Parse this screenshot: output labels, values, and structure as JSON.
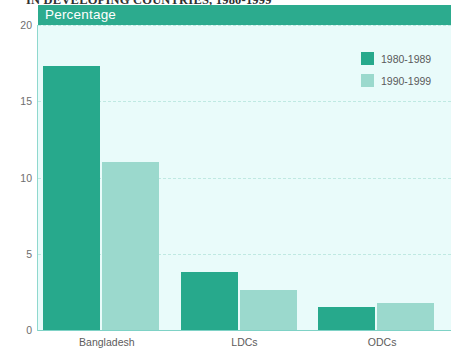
{
  "figure": {
    "title_top": "IN DEVELOPING COUNTRIES, 1980-1999",
    "band_label": "Percentage"
  },
  "colors": {
    "series_1980s": "#27a98c",
    "series_1990s": "#9bd9cd",
    "band": "#2cab8e",
    "plot_background": "#e9fbfa",
    "gridline": "#bfe9e2",
    "axis": "#7fd2c6"
  },
  "legend": {
    "position": "top-right",
    "entries": [
      {
        "label": "1980-1989",
        "color": "#27a98c"
      },
      {
        "label": "1990-1999",
        "color": "#9bd9cd"
      }
    ]
  },
  "chart_data": {
    "type": "bar",
    "title": "IN DEVELOPING COUNTRIES, 1980-1999",
    "subtitle": "Percentage",
    "xlabel": "",
    "ylabel": "Percentage",
    "ylim": [
      0,
      20
    ],
    "yticks": [
      0,
      5,
      10,
      15,
      20
    ],
    "ytick_labels": [
      "0",
      "5",
      "10",
      "15",
      "20"
    ],
    "grid": true,
    "categories": [
      "Bangladesh",
      "LDCs",
      "ODCs"
    ],
    "series": [
      {
        "name": "1980-1989",
        "color": "#27a98c",
        "values": [
          17.3,
          3.8,
          1.5
        ]
      },
      {
        "name": "1990-1999",
        "color": "#9bd9cd",
        "values": [
          11.0,
          2.6,
          1.8
        ]
      }
    ]
  }
}
